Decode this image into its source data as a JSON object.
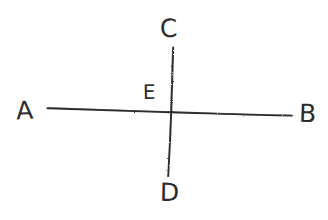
{
  "figure": {
    "background_color": "#ffffff",
    "stroke_color": "#2b2b2b",
    "style": "hand-drawn pencil sketch",
    "labels": {
      "a": "A",
      "b": "B",
      "c": "C",
      "d": "D",
      "e": "E"
    },
    "lines": [
      {
        "name": "line-AB",
        "from_label": "A",
        "to_label": "B",
        "orientation": "horizontal",
        "x1": 47,
        "y1": 108,
        "x2": 292,
        "y2": 116
      },
      {
        "name": "line-CD",
        "from_label": "C",
        "to_label": "D",
        "orientation": "vertical",
        "x1": 173,
        "y1": 47,
        "x2": 168,
        "y2": 176
      }
    ],
    "intersection": {
      "name": "point-E",
      "label": "E",
      "x": 171,
      "y": 112
    }
  }
}
